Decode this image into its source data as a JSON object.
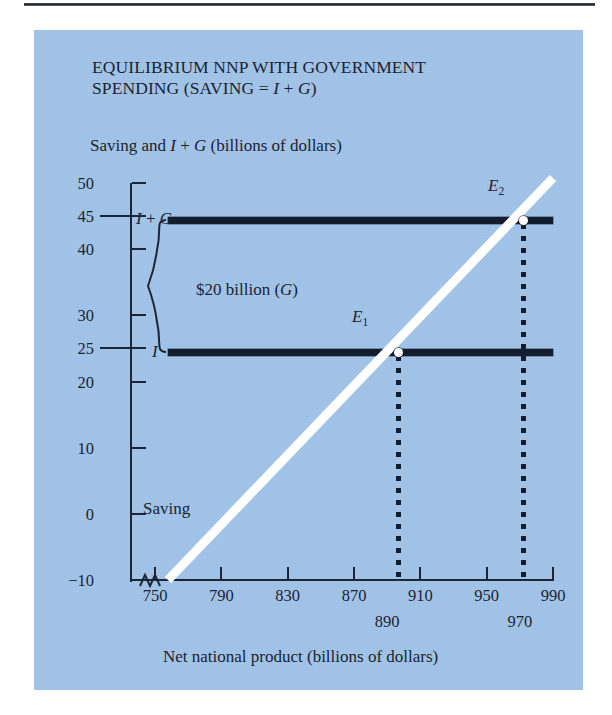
{
  "figure": {
    "title_line1": "EQUILIBRIUM NNP WITH GOVERNMENT",
    "title_line2_pre": "SPENDING (SAVING = ",
    "title_line2_italic1": "I",
    "title_line2_mid": " + ",
    "title_line2_italic2": "G",
    "title_line2_post": ")",
    "panel_color": "#9cc0e6",
    "line_color": "#141d2d",
    "saving_line_color": "#ffffff"
  },
  "axes": {
    "y_title_pre": "Saving and ",
    "y_title_italic1": "I",
    "y_title_mid": " + ",
    "y_title_italic2": "G",
    "y_title_post": " (billions of dollars)",
    "y_title_full": "Saving and I + G (billions of dollars)",
    "x_title": "Net national product (billions of dollars)",
    "y_ticks": [
      "50",
      "45",
      "40",
      "30",
      "25",
      "20",
      "10",
      "0",
      "-10"
    ],
    "y_emphasis_ticks": [
      "45",
      "25"
    ],
    "x_ticks": [
      "750",
      "790",
      "830",
      "870",
      "910",
      "950",
      "990"
    ],
    "x_callout_ticks": [
      "890",
      "970"
    ]
  },
  "series": {
    "i_plus_g_label_pre": "I",
    "i_plus_g_label_mid": " + ",
    "i_plus_g_label_post": "G",
    "i_plus_g_label": "I + G",
    "i_label": "I",
    "saving_label": "Saving",
    "brace_label_pre": "$20 billion (",
    "brace_label_italic": "G",
    "brace_label_post": ")",
    "brace_label": "$20 billion (G)"
  },
  "points": {
    "e1_label": "E",
    "e1_sub": "1",
    "e2_label": "E",
    "e2_sub": "2"
  },
  "chart_data": {
    "type": "line",
    "xlabel": "Net national product (billions of dollars)",
    "ylabel": "Saving and I + G (billions of dollars)",
    "xlim": [
      750,
      990
    ],
    "ylim": [
      -10,
      50
    ],
    "xticks": [
      750,
      790,
      830,
      870,
      910,
      950,
      990
    ],
    "yticks": [
      -10,
      0,
      10,
      20,
      25,
      30,
      40,
      45,
      50
    ],
    "grid": false,
    "legend": "inline-annotations",
    "series": [
      {
        "name": "Saving",
        "style": "solid-white-thick",
        "x": [
          750,
          990
        ],
        "y": [
          -10,
          50
        ],
        "slope_per_billion": 0.25,
        "description": "Saving schedule rising from -10 at NNP 750 to 50 at NNP 990"
      },
      {
        "name": "I",
        "style": "solid-black-thick-horizontal",
        "x": [
          756,
          990
        ],
        "y": [
          25,
          25
        ],
        "value": 25
      },
      {
        "name": "I + G",
        "style": "solid-black-thick-horizontal",
        "x": [
          756,
          990
        ],
        "y": [
          45,
          45
        ],
        "value": 45
      }
    ],
    "points": [
      {
        "name": "E1",
        "x": 890,
        "y": 25,
        "marker": "open-white-circle"
      },
      {
        "name": "E2",
        "x": 970,
        "y": 45,
        "marker": "open-white-circle"
      }
    ],
    "annotations": [
      {
        "text": "$20 billion (G)",
        "type": "brace",
        "y_from": 25,
        "y_to": 45,
        "x": 760
      },
      {
        "text": "Saving",
        "type": "label",
        "x": 762,
        "y": 2
      },
      {
        "text": "E1",
        "type": "point-label",
        "x": 880,
        "y": 31
      },
      {
        "text": "E2",
        "type": "point-label",
        "x": 960,
        "y": 51
      },
      {
        "text": "890",
        "type": "x-callout",
        "x": 890
      },
      {
        "text": "970",
        "type": "x-callout",
        "x": 970
      }
    ],
    "dropline_x": [
      890,
      970
    ],
    "axis_break": "x-axis broken between 0 and 750"
  }
}
